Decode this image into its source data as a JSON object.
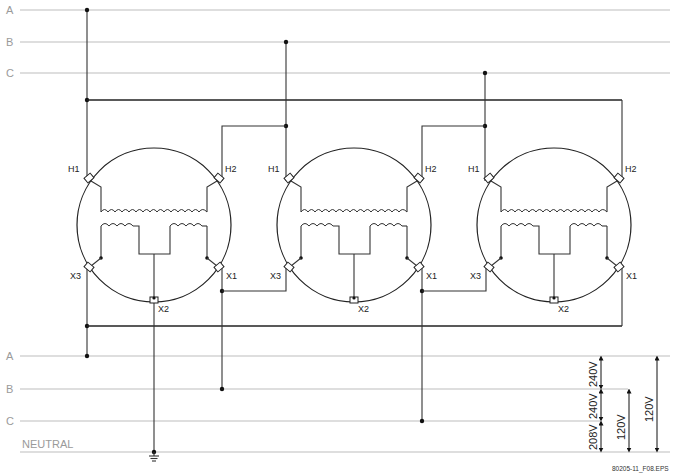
{
  "diagram": {
    "type": "three-phase transformer bank wiring (delta, center-tapped secondary)",
    "primary_lines": [
      {
        "label": "A",
        "y": 10
      },
      {
        "label": "B",
        "y": 42
      },
      {
        "label": "C",
        "y": 73
      }
    ],
    "secondary_lines": [
      {
        "label": "A",
        "y": 356
      },
      {
        "label": "B",
        "y": 389
      },
      {
        "label": "C",
        "y": 421
      },
      {
        "label": "NEUTRAL",
        "y": 452
      }
    ],
    "transformers": [
      {
        "name": "T1",
        "cx": 154,
        "h1": "H1",
        "h2": "H2",
        "x1": "X1",
        "x2": "X2",
        "x3": "X3"
      },
      {
        "name": "T2",
        "cx": 354,
        "h1": "H1",
        "h2": "H2",
        "x1": "X1",
        "x2": "X2",
        "x3": "X3"
      },
      {
        "name": "T3",
        "cx": 554,
        "h1": "H1",
        "h2": "H2",
        "x1": "X1",
        "x2": "X2",
        "x3": "X3"
      }
    ],
    "voltages": {
      "a_b": "240V",
      "b_c": "240V",
      "c_n": "208V",
      "b_n": "120V",
      "a_n": "120V"
    },
    "file_label": "80205-11_F08.EPS"
  }
}
